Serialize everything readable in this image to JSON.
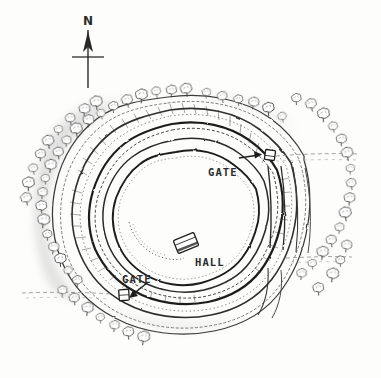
{
  "figure": {
    "type": "hand-drawn archaeological site plan",
    "background_color": "#fdfdfc",
    "ink_color": "#2b2b2b",
    "shading_color": "#b9b9b9"
  },
  "compass": {
    "name": "north-arrow",
    "label": "N",
    "x": 88,
    "y": 22,
    "points_to": "up"
  },
  "labels": [
    {
      "id": "gate-ne",
      "text": "GATE",
      "x": 208,
      "y": 172,
      "arrow": "right",
      "arrow_from": [
        238,
        158
      ],
      "arrow_to": [
        262,
        154
      ]
    },
    {
      "id": "gate-sw",
      "text": "GATE",
      "x": 122,
      "y": 279,
      "arrow": "down-left",
      "arrow_from": [
        148,
        284
      ],
      "arrow_to": [
        129,
        298
      ]
    },
    {
      "id": "hall",
      "text": "HALL",
      "x": 195,
      "y": 262,
      "arrow": "none",
      "arrow_from": [
        0,
        0
      ],
      "arrow_to": [
        0,
        0
      ]
    }
  ],
  "structures": [
    {
      "id": "hall-building",
      "name": "hall-building",
      "cx": 186,
      "cy": 243,
      "w": 20,
      "h": 13,
      "rotate": -22
    },
    {
      "id": "gate-ne-building",
      "name": "gate-building-northeast",
      "cx": 270,
      "cy": 155,
      "w": 9,
      "h": 9,
      "rotate": 8
    },
    {
      "id": "gate-sw-building",
      "name": "gate-building-southwest",
      "cx": 124,
      "cy": 295,
      "w": 9,
      "h": 10,
      "rotate": -4
    }
  ],
  "ramparts": {
    "count": 5,
    "description": "concentric banks and ditches drawn as wavy parallel ink lines with grey hachure shading",
    "breaks": [
      {
        "id": "track-east-upper",
        "y": 156,
        "side": "east"
      },
      {
        "id": "track-east-lower",
        "y": 258,
        "side": "east"
      },
      {
        "id": "track-west",
        "y": 293,
        "side": "west"
      }
    ]
  },
  "interior_feature": {
    "id": "quarry-scoop",
    "name": "dotted-interior-bank",
    "description": "short dotted/stippled curved scarp west of the hall"
  },
  "trees": {
    "symbol": "small bushy tree",
    "count": 58,
    "positions": [
      [
        101,
        115
      ],
      [
        113,
        108
      ],
      [
        127,
        102
      ],
      [
        141,
        97
      ],
      [
        156,
        93
      ],
      [
        171,
        92
      ],
      [
        186,
        91
      ],
      [
        206,
        94
      ],
      [
        222,
        98
      ],
      [
        88,
        122
      ],
      [
        76,
        131
      ],
      [
        66,
        142
      ],
      [
        58,
        154
      ],
      [
        50,
        167
      ],
      [
        45,
        180
      ],
      [
        42,
        194
      ],
      [
        41,
        208
      ],
      [
        43,
        222
      ],
      [
        47,
        236
      ],
      [
        53,
        249
      ],
      [
        60,
        261
      ],
      [
        68,
        272
      ],
      [
        77,
        282
      ],
      [
        26,
        200
      ],
      [
        28,
        185
      ],
      [
        33,
        170
      ],
      [
        40,
        156
      ],
      [
        48,
        143
      ],
      [
        58,
        131
      ],
      [
        70,
        120
      ],
      [
        84,
        111
      ],
      [
        96,
        104
      ],
      [
        62,
        292
      ],
      [
        74,
        300
      ],
      [
        87,
        310
      ],
      [
        100,
        319
      ],
      [
        114,
        327
      ],
      [
        128,
        334
      ],
      [
        143,
        339
      ],
      [
        238,
        101
      ],
      [
        253,
        104
      ],
      [
        268,
        110
      ],
      [
        282,
        118
      ],
      [
        296,
        100
      ],
      [
        311,
        106
      ],
      [
        323,
        116
      ],
      [
        333,
        128
      ],
      [
        341,
        141
      ],
      [
        347,
        155
      ],
      [
        350,
        170
      ],
      [
        351,
        185
      ],
      [
        349,
        200
      ],
      [
        345,
        215
      ],
      [
        339,
        229
      ],
      [
        331,
        242
      ],
      [
        322,
        254
      ],
      [
        312,
        265
      ],
      [
        301,
        275
      ],
      [
        318,
        290
      ],
      [
        332,
        276
      ],
      [
        340,
        262
      ],
      [
        346,
        247
      ]
    ]
  },
  "annotations": {
    "title": "",
    "scale": "",
    "credit": ""
  }
}
